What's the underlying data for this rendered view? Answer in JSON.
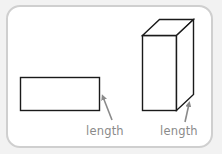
{
  "figure": {
    "colors": {
      "background": "#f2f2f2",
      "frame_fill": "#ffffff",
      "frame_border": "#cfcfcf",
      "shape_stroke": "#1a1a1a",
      "arrow": "#8a8a8a",
      "label_text": "#8a8a8a"
    },
    "shapes": [
      {
        "type": "rectangle",
        "label": "length",
        "dimension_indicated": "right edge"
      },
      {
        "type": "rectangular-prism",
        "label": "length",
        "dimension_indicated": "bottom-right depth edge"
      }
    ]
  }
}
